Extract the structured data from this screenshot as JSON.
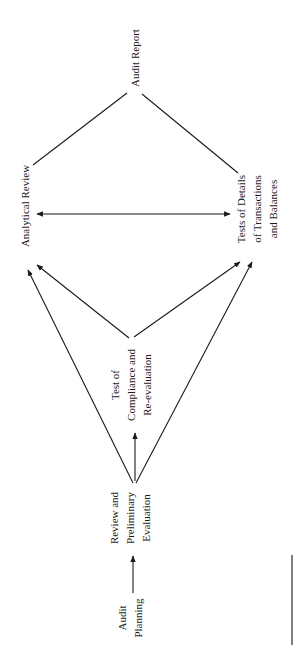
{
  "diagram": {
    "nodes": {
      "audit_planning": {
        "lines": [
          "Audit",
          "Planning"
        ]
      },
      "review_prelim": {
        "lines": [
          "Review and",
          "Preliminary",
          "Evaluation"
        ]
      },
      "test_compliance": {
        "lines": [
          "Test of",
          "Compliance and",
          "Re-evaluation"
        ]
      },
      "analytical_review": {
        "lines": [
          "Analytical Review"
        ]
      },
      "tests_details": {
        "lines": [
          "Tests of Details",
          "of Transactions",
          "and Balances"
        ]
      },
      "audit_report": {
        "lines": [
          "Audit Report"
        ]
      }
    },
    "edges": [
      {
        "from": "Audit Planning",
        "to": "Review and Preliminary Evaluation",
        "type": "arrow"
      },
      {
        "from": "Review and Preliminary Evaluation",
        "to": "Test of Compliance and Re-evaluation",
        "type": "arrow"
      },
      {
        "from": "Review and Preliminary Evaluation",
        "to": "Analytical Review",
        "type": "arrow"
      },
      {
        "from": "Review and Preliminary Evaluation",
        "to": "Tests of Details of Transactions and Balances",
        "type": "arrow"
      },
      {
        "from": "Test of Compliance and Re-evaluation",
        "to": "Analytical Review",
        "type": "arrow"
      },
      {
        "from": "Test of Compliance and Re-evaluation",
        "to": "Tests of Details of Transactions and Balances",
        "type": "arrow"
      },
      {
        "from": "Analytical Review",
        "to": "Tests of Details of Transactions and Balances",
        "type": "double-arrow"
      },
      {
        "from": "Analytical Review",
        "to": "Audit Report",
        "type": "line"
      },
      {
        "from": "Tests of Details of Transactions and Balances",
        "to": "Audit Report",
        "type": "line"
      }
    ],
    "orientation": "rotated-90-ccw"
  }
}
